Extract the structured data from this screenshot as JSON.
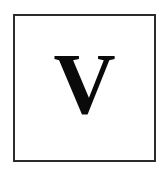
{
  "card": {
    "letter": "V",
    "letter_name": "capital-letter-v",
    "background_color": "#ffffff",
    "letter_color": "#0a0a0a",
    "border_color": "#2b2b2b",
    "border_width_px": 2,
    "frame": {
      "left_px": 13,
      "top_px": 14,
      "width_px": 143,
      "height_px": 148
    },
    "canvas": {
      "width_px": 165,
      "height_px": 175
    }
  }
}
